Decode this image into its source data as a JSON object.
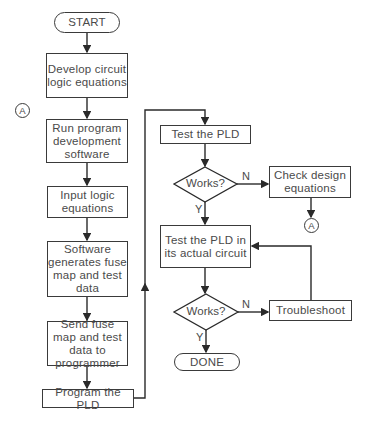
{
  "flowchart": {
    "start": "START",
    "develop": "Develop circuit logic equations",
    "run_software": "Run program development software",
    "input_equations": "Input logic equations",
    "software_generates": "Software generates fuse map and test data",
    "send_fuse_map": "Send fuse map and test data to programmer",
    "program_pld": "Program the PLD",
    "test_pld": "Test the PLD",
    "decision1": "Works?",
    "decision1_no": "N",
    "decision1_yes": "Y",
    "check_design": "Check design equations",
    "test_actual": "Test the PLD in its actual circuit",
    "decision2": "Works?",
    "decision2_no": "N",
    "decision2_yes": "Y",
    "troubleshoot": "Troubleshoot",
    "done": "DONE",
    "connector_left": "A",
    "connector_right": "A"
  }
}
